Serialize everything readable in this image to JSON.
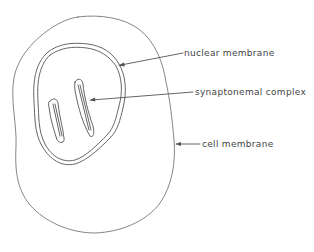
{
  "diagram": {
    "labels": {
      "nuclear_membrane": "nuclear membrane",
      "synaptonemal_complex": "synaptonemal complex",
      "cell_membrane": "cell membrane"
    },
    "colors": {
      "line": "#777777",
      "text": "#444444",
      "background": "#ffffff"
    }
  }
}
